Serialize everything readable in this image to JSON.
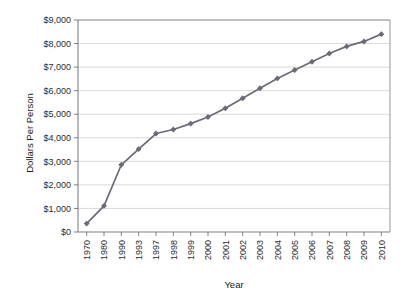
{
  "chart_data": {
    "type": "line",
    "title": "",
    "xlabel": "Year",
    "ylabel": "Dollars Per Person",
    "categories": [
      "1970",
      "1980",
      "1990",
      "1993",
      "1997",
      "1998",
      "1999",
      "2000",
      "2001",
      "2002",
      "2003",
      "2004",
      "2005",
      "2006",
      "2007",
      "2008",
      "2009",
      "2010"
    ],
    "values": [
      356,
      1110,
      2854,
      3520,
      4180,
      4350,
      4600,
      4880,
      5250,
      5680,
      6100,
      6520,
      6880,
      7230,
      7580,
      7880,
      8090,
      8400
    ],
    "series": [
      {
        "name": "Dollars Per Person",
        "values": [
          356,
          1110,
          2854,
          3520,
          4180,
          4350,
          4600,
          4880,
          5250,
          5680,
          6100,
          6520,
          6880,
          7230,
          7580,
          7880,
          8090,
          8400
        ],
        "color": "#6b6b78"
      }
    ],
    "ylim": [
      0,
      9000
    ],
    "ytick_values": [
      0,
      1000,
      2000,
      3000,
      4000,
      5000,
      6000,
      7000,
      8000,
      9000
    ],
    "ytick_labels": [
      "$0",
      "$1,000",
      "$2,000",
      "$3,000",
      "$4,000",
      "$5,000",
      "$6,000",
      "$7,000",
      "$8,000",
      "$9,000"
    ],
    "grid": "horizontal",
    "legend": "none",
    "marker": "diamond",
    "xtick_label_rotation": -90
  },
  "colors": {
    "line": "#6b6b78",
    "marker": "#6b6b78",
    "grid": "#c8c8c8",
    "axis": "#808088",
    "text": "#2b2b2b",
    "background": "#ffffff"
  }
}
